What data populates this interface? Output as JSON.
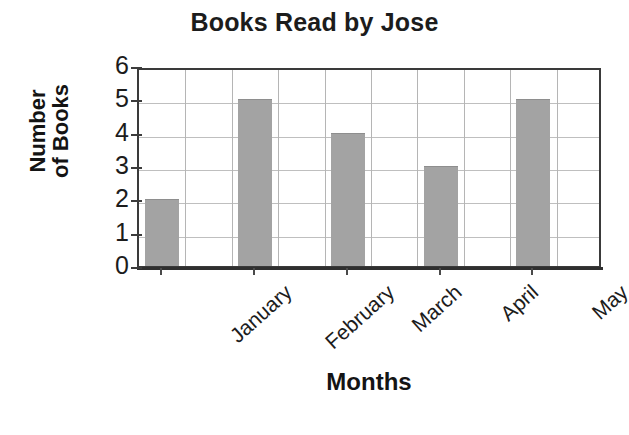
{
  "chart_data": {
    "type": "bar",
    "title": "Books Read by Jose",
    "xlabel": "Months",
    "ylabel": "Number of Books",
    "ylabel_lines": [
      "Number",
      "of Books"
    ],
    "categories": [
      "January",
      "February",
      "March",
      "April",
      "May"
    ],
    "values": [
      2,
      5,
      4,
      3,
      5
    ],
    "ylim": [
      0,
      6
    ],
    "yticks": [
      0,
      1,
      2,
      3,
      4,
      5,
      6
    ],
    "ytick_labels": [
      "0",
      "1",
      "2",
      "3",
      "4",
      "5",
      "6"
    ],
    "grid": true,
    "grid_axis": "both",
    "legend": false,
    "legend_position": "none",
    "bar_color": "#a3a3a3",
    "plot_background": "#ffffff",
    "grid_color": "#bfbfbf",
    "axis_color": "#3a3a3a",
    "text_color": "#1c1c1c",
    "xtick_label_rotation": -42
  }
}
